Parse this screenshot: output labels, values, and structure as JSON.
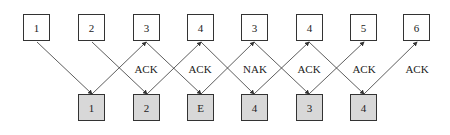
{
  "diagram": {
    "top_frames": [
      "1",
      "2",
      "3",
      "4",
      "3",
      "4",
      "5",
      "6"
    ],
    "bottom_frames": [
      "1",
      "2",
      "E",
      "4",
      "3",
      "4"
    ],
    "responses": [
      "ACK",
      "ACK",
      "NAK",
      "ACK",
      "ACK",
      "ACK"
    ],
    "colors": {
      "top_fill": "#ffffff",
      "bottom_fill": "#d8d8d8",
      "stroke": "#333333"
    }
  }
}
